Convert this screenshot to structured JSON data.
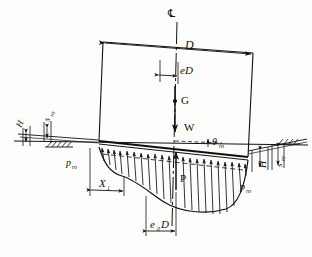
{
  "figure": {
    "domain": "engineering-diagram",
    "background_color": "#fdfdfc",
    "line_color": "#111111"
  },
  "labels": {
    "centerline_symbol": "℄",
    "diameter": "D",
    "eccentricity": "eD",
    "cg_point": "G",
    "weight_force": "W",
    "rotation_angle": "θ",
    "rotation_angle_sub": "ro",
    "pressure_left": "p",
    "pressure_left_sub": "ro",
    "pressure_right": "p",
    "pressure_right_sub": "ro",
    "reaction_force": "P",
    "dimension_x1": "X",
    "dimension_x1_sub": "1",
    "dimension_e0d": "e",
    "dimension_e0d_sub": "0",
    "dimension_e0d_tail": "D",
    "embedment_left": "H",
    "settlement_left": "s",
    "settlement_left_sub": "ro",
    "embedment_right": "H",
    "settlement_right": "s",
    "settlement_right_sub": "ro"
  },
  "annotations": [
    {
      "name": "centerline",
      "text": "℄",
      "meaning": "centre line of foundation"
    },
    {
      "name": "diameter-dimension",
      "text": "D",
      "meaning": "foundation diameter"
    },
    {
      "name": "eccentricity-dimension",
      "text": "eD",
      "meaning": "load eccentricity"
    },
    {
      "name": "centre-of-gravity",
      "text": "G",
      "meaning": "centre of gravity"
    },
    {
      "name": "weight-vector",
      "text": "W",
      "meaning": "vertical load"
    },
    {
      "name": "rotation-angle",
      "text": "θro",
      "meaning": "rotation of foundation"
    },
    {
      "name": "bearing-pressure-left",
      "text": "pro",
      "meaning": "bearing pressure"
    },
    {
      "name": "bearing-pressure-right",
      "text": "pro",
      "meaning": "bearing pressure"
    },
    {
      "name": "resultant-reaction",
      "text": "P",
      "meaning": "resultant soil reaction"
    },
    {
      "name": "x1-dimension",
      "text": "X1",
      "meaning": "width of uplift / reduced contact zone"
    },
    {
      "name": "e0d-dimension",
      "text": "e0D",
      "meaning": "eccentricity of resultant reaction"
    },
    {
      "name": "embedment-left",
      "text": "H",
      "meaning": "embedment depth"
    },
    {
      "name": "settlement-left",
      "text": "sro",
      "meaning": "settlement"
    },
    {
      "name": "embedment-right",
      "text": "H",
      "meaning": "embedment depth"
    },
    {
      "name": "settlement-right",
      "text": "sro",
      "meaning": "settlement"
    }
  ]
}
